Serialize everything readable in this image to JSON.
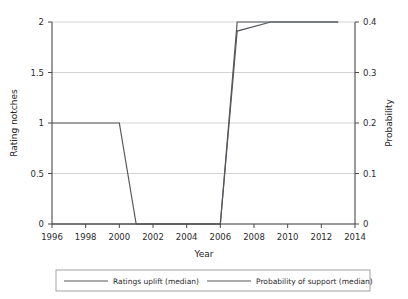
{
  "chart_data": {
    "type": "line",
    "title": "",
    "xlabel": "Year",
    "ylabel": "Rating notches",
    "y2label": "Probability",
    "xlim": [
      1996,
      2014
    ],
    "ylim": [
      0,
      2
    ],
    "y2lim": [
      0,
      0.4
    ],
    "grid": true,
    "legend_position": "bottom",
    "xticks": [
      "1996",
      "1998",
      "2000",
      "2002",
      "2004",
      "2006",
      "2008",
      "2010",
      "2012",
      "2014"
    ],
    "xtick_values": [
      1996,
      1998,
      2000,
      2002,
      2004,
      2006,
      2008,
      2010,
      2012,
      2014
    ],
    "yticks": [
      "0",
      "0.5",
      "1",
      "1.5",
      "2"
    ],
    "ytick_values": [
      0,
      0.5,
      1,
      1.5,
      2
    ],
    "y2ticks": [
      "0",
      "0.1",
      "0.2",
      "0.3",
      "0.4"
    ],
    "y2tick_values": [
      0,
      0.1,
      0.2,
      0.3,
      0.4
    ],
    "series": [
      {
        "name": "Ratings uplift (median)",
        "axis": "left",
        "x": [
          1996,
          2000,
          2001,
          2006,
          2007,
          2013
        ],
        "values": [
          1,
          1,
          0,
          0,
          2,
          2
        ]
      },
      {
        "name": "Probability of support (median)",
        "axis": "right",
        "x": [
          1996,
          2006,
          2007,
          2009,
          2013
        ],
        "values": [
          0,
          0,
          0.382,
          0.4,
          0.4
        ]
      }
    ]
  },
  "legend": {
    "entries": [
      {
        "label": "Ratings uplift (median)"
      },
      {
        "label": "Probability of support (median)"
      }
    ]
  },
  "colors": {
    "line": "#55585c",
    "grid": "#c9c9c9",
    "axis": "#4a4a4a",
    "text": "#2b2b2b",
    "background": "#ffffff"
  }
}
